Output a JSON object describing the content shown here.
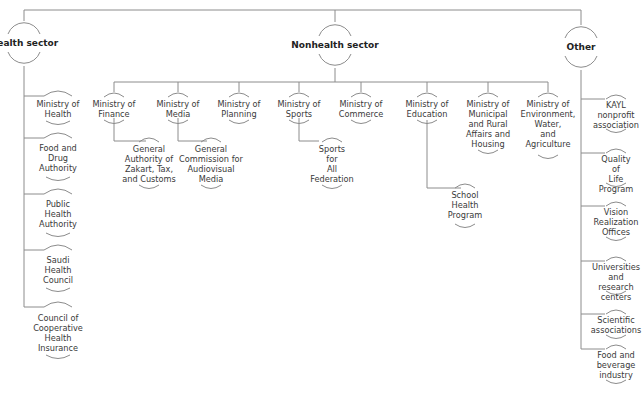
{
  "diagram": {
    "type": "hierarchy",
    "line_color": "#8c8c8c",
    "root_children": [
      {
        "id": "health",
        "label": "Health sector",
        "children": [
          {
            "label": "Ministry of\nHealth"
          },
          {
            "label": "Food and\nDrug\nAuthority"
          },
          {
            "label": "Public\nHealth\nAuthority"
          },
          {
            "label": "Saudi\nHealth\nCouncil"
          },
          {
            "label": "Council of\nCooperative\nHealth\nInsurance"
          }
        ]
      },
      {
        "id": "nonhealth",
        "label": "Nonhealth sector",
        "children": [
          {
            "label": "Ministry of\nFinance",
            "children": [
              {
                "label": "General\nAuthority of\nZakart, Tax,\nand Customs"
              }
            ]
          },
          {
            "label": "Ministry of\nMedia",
            "children": [
              {
                "label": "General\nCommission for\nAudiovisual\nMedia"
              }
            ]
          },
          {
            "label": "Ministry of\nPlanning"
          },
          {
            "label": "Ministry of\nSports",
            "children": [
              {
                "label": "Sports\nfor\nAll\nFederation"
              }
            ]
          },
          {
            "label": "Ministry of\nCommerce"
          },
          {
            "label": "Ministry of\nEducation",
            "children": [
              {
                "label": "School\nHealth\nProgram"
              }
            ]
          },
          {
            "label": "Ministry of\nMunicipal\nand Rural\nAffairs and\nHousing"
          },
          {
            "label": "Ministry of\nEnvironment,\nWater,\nand\nAgriculture"
          }
        ]
      },
      {
        "id": "other",
        "label": "Other",
        "children": [
          {
            "label": "KAYL\nnonprofit\nassociation"
          },
          {
            "label": "Quality of\nLife\nProgram"
          },
          {
            "label": "Vision\nRealization\nOffices"
          },
          {
            "label": "Universities\nand research\ncenters"
          },
          {
            "label": "Scientific\nassociations"
          },
          {
            "label": "Food and\nbeverage\nindustry"
          }
        ]
      }
    ]
  }
}
